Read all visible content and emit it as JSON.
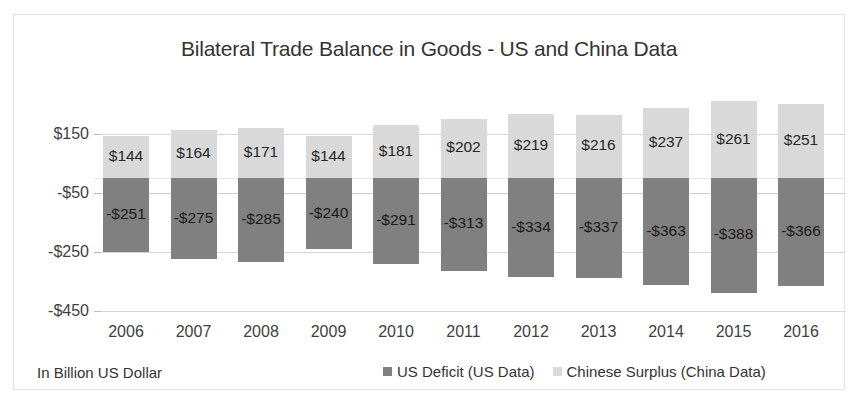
{
  "chart_data": {
    "type": "bar",
    "subtype": "stacked-diverging",
    "title": "Bilateral Trade Balance in Goods - US and China Data",
    "xlabel": "",
    "ylabel": "",
    "units_note": "In Billion US Dollar",
    "ylim": [
      -450,
      350
    ],
    "yticks": [
      150,
      -50,
      -250,
      -450
    ],
    "ytick_labels": [
      "$150",
      "-$50",
      "-$250",
      "-$450"
    ],
    "grid": true,
    "legend_position": "bottom-right",
    "categories": [
      "2006",
      "2007",
      "2008",
      "2009",
      "2010",
      "2011",
      "2012",
      "2013",
      "2014",
      "2015",
      "2016"
    ],
    "series": [
      {
        "name": "US Deficit (US Data)",
        "color": "#808080",
        "values": [
          -251,
          -275,
          -285,
          -240,
          -291,
          -313,
          -334,
          -337,
          -363,
          -388,
          -366
        ],
        "labels": [
          "-$251",
          "-$275",
          "-$285",
          "-$240",
          "-$291",
          "-$313",
          "-$334",
          "-$337",
          "-$363",
          "-$388",
          "-$366"
        ]
      },
      {
        "name": "Chinese Surplus (China Data)",
        "color": "#d9d9d9",
        "values": [
          144,
          164,
          171,
          144,
          181,
          202,
          219,
          216,
          237,
          261,
          251
        ],
        "labels": [
          "$144",
          "$164",
          "$171",
          "$144",
          "$181",
          "$202",
          "$219",
          "$216",
          "$237",
          "$261",
          "$251"
        ]
      }
    ]
  },
  "footer": {
    "note": "In Billion US Dollar"
  },
  "legend": {
    "items": [
      {
        "label": "US Deficit (US Data)",
        "color": "#808080"
      },
      {
        "label": "Chinese Surplus (China Data)",
        "color": "#d9d9d9"
      }
    ]
  },
  "colors": {
    "deficit": "#808080",
    "surplus": "#d9d9d9",
    "grid": "#d6d6d6",
    "text": "#333333",
    "frame": "#e3e3e3"
  }
}
